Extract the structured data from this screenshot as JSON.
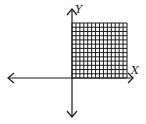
{
  "diagram": {
    "type": "coordinate-plane",
    "axes": {
      "x_label": "X",
      "y_label": "Y",
      "arrows": [
        "left",
        "right",
        "up",
        "down"
      ]
    },
    "shaded_region": {
      "quadrant": "I",
      "pattern": "grid",
      "columns": 14,
      "rows": 13
    },
    "colors": {
      "ink": "#1a1a1a",
      "background": "#ffffff"
    }
  }
}
